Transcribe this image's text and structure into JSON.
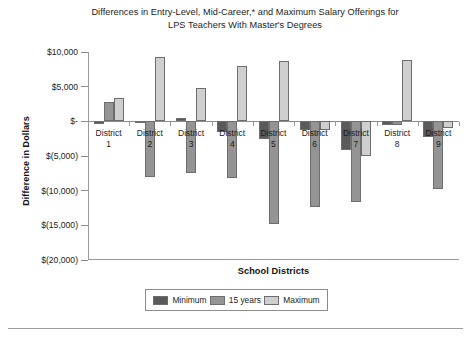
{
  "chart_data": {
    "type": "bar",
    "title": "Differences in Entry-Level, Mid-Career,* and Maximum Salary Offerings for LPS Teachers With Master's Degrees",
    "title_lines": [
      "Differences in Entry-Level, Mid-Career,* and Maximum Salary Offerings for",
      "LPS Teachers With Master's Degrees"
    ],
    "xlabel": "School Districts",
    "ylabel": "Difference in Dollars",
    "categories": [
      "District 1",
      "District 2",
      "District 3",
      "District 4",
      "District 5",
      "District 6",
      "District 7",
      "District 8",
      "District 9"
    ],
    "category_lines": [
      [
        "District",
        "1"
      ],
      [
        "District",
        "2"
      ],
      [
        "District",
        "3"
      ],
      [
        "District",
        "4"
      ],
      [
        "District",
        "5"
      ],
      [
        "District",
        "6"
      ],
      [
        "District",
        "7"
      ],
      [
        "District",
        "8"
      ],
      [
        "District",
        "9"
      ]
    ],
    "series": [
      {
        "name": "Minimum",
        "color": "#5a5a5a",
        "values": [
          -400,
          -100,
          500,
          -1500,
          -2500,
          -1300,
          -4200,
          -500,
          -2200
        ]
      },
      {
        "name": "15 years",
        "color": "#949494",
        "values": [
          2800,
          -8000,
          -7400,
          -8200,
          -14800,
          -12300,
          -11600,
          -600,
          -9800
        ]
      },
      {
        "name": "Maximum",
        "color": "#cfcfcf",
        "values": [
          3400,
          9300,
          4800,
          8000,
          8700,
          -1300,
          -5000,
          8900,
          -1000
        ]
      }
    ],
    "ylim": [
      -20000,
      10000
    ],
    "ytick_values": [
      10000,
      5000,
      0,
      -5000,
      -10000,
      -15000,
      -20000
    ],
    "ytick_labels": [
      "$10,000",
      "$5,000",
      "$-",
      "$(5,000)",
      "$(10,000)",
      "$(15,000)",
      "$(20,000)"
    ],
    "grid": false,
    "legend_position": "bottom"
  },
  "legend": {
    "items": [
      {
        "label": "Minimum",
        "swatch": "minimum"
      },
      {
        "label": "15 years",
        "swatch": "years15"
      },
      {
        "label": "Maximum",
        "swatch": "maximum"
      }
    ]
  }
}
